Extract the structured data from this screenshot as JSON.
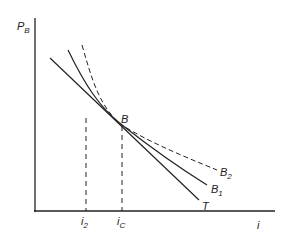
{
  "axes": {
    "y_label": "P",
    "y_label_sub": "B",
    "x_label": "i"
  },
  "curves": [
    {
      "name": "T",
      "label": "T",
      "label_sub": "",
      "style": "solid"
    },
    {
      "name": "B1",
      "label": "B",
      "label_sub": "1",
      "style": "solid"
    },
    {
      "name": "B2",
      "label": "B",
      "label_sub": "2",
      "style": "dashed"
    }
  ],
  "point": {
    "label": "B"
  },
  "x_ticks": [
    {
      "label": "i",
      "sub": "2"
    },
    {
      "label": "i",
      "sub": "C"
    }
  ],
  "colors": {
    "line": "#222222",
    "background": "#ffffff"
  }
}
